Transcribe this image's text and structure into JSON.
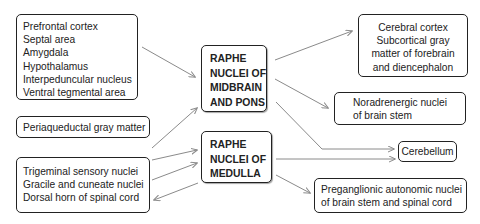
{
  "diagram": {
    "hubs": {
      "midbrain_pons": [
        "RAPHE",
        "NUCLEI OF",
        "MIDBRAIN",
        "AND PONS"
      ],
      "medulla": [
        "RAPHE",
        "NUCLEI OF",
        "MEDULLA"
      ]
    },
    "inputs": {
      "forebrain_group": [
        "Prefrontal cortex",
        "Septal area",
        "Amygdala",
        "Hypothalamus",
        "Interpeduncular nucleus",
        "Ventral tegmental area"
      ],
      "pag": [
        "Periaqueductal gray matter"
      ],
      "sensory_group": [
        "Trigeminal sensory nuclei",
        "Gracile and cuneate nuclei",
        "Dorsal horn of spinal cord"
      ]
    },
    "outputs": {
      "cortex": [
        "Cerebral cortex",
        "Subcortical gray",
        "matter of forebrain",
        "and diencephalon"
      ],
      "noradrenergic": [
        "Noradrenergic nuclei",
        "of brain stem"
      ],
      "cerebellum": [
        "Cerebellum"
      ],
      "preganglionic": [
        "Preganglionic autonomic nuclei",
        "of brain stem and spinal cord"
      ]
    },
    "colors": {
      "arrow": "#8a8a8a",
      "border": "#222222"
    }
  }
}
